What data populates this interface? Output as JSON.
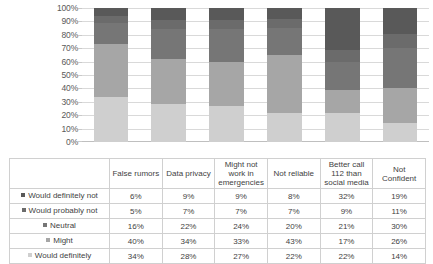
{
  "chart_data": {
    "type": "bar",
    "stacked": true,
    "normalized_percent": true,
    "title": "",
    "subtitle": "",
    "xlabel": "",
    "ylabel": "",
    "ylim": [
      0,
      100
    ],
    "y_tick_labels": [
      "100%",
      "90%",
      "80%",
      "70%",
      "60%",
      "50%",
      "40%",
      "30%",
      "20%",
      "10%",
      "0%"
    ],
    "y_tick_values": [
      100,
      90,
      80,
      70,
      60,
      50,
      40,
      30,
      20,
      10,
      0
    ],
    "grid": "horizontal",
    "legend_position": "data-table-below",
    "categories": [
      "False rumors",
      "Data privacy",
      "Might not work in emergencies",
      "Not reliable",
      "Better call 112 than social media",
      "Not Confident"
    ],
    "series": [
      {
        "name": "Would definitely not",
        "color": "#595959",
        "stack_order": 5,
        "values": [
          6,
          9,
          9,
          8,
          32,
          19
        ],
        "labels": [
          "6%",
          "9%",
          "9%",
          "8%",
          "32%",
          "19%"
        ]
      },
      {
        "name": "Would probably not",
        "color": "#6b6b6b",
        "stack_order": 4,
        "values": [
          5,
          7,
          7,
          7,
          9,
          11
        ],
        "labels": [
          "5%",
          "7%",
          "7%",
          "7%",
          "9%",
          "11%"
        ]
      },
      {
        "name": "Neutral",
        "color": "#767676",
        "stack_order": 3,
        "values": [
          16,
          22,
          24,
          20,
          21,
          30
        ],
        "labels": [
          "16%",
          "22%",
          "24%",
          "20%",
          "21%",
          "30%"
        ]
      },
      {
        "name": "Might",
        "color": "#a6a6a6",
        "stack_order": 2,
        "values": [
          40,
          34,
          33,
          43,
          17,
          26
        ],
        "labels": [
          "40%",
          "34%",
          "33%",
          "43%",
          "17%",
          "26%"
        ]
      },
      {
        "name": "Would definitely",
        "color": "#cfcfcf",
        "stack_order": 1,
        "values": [
          34,
          28,
          27,
          22,
          22,
          14
        ],
        "labels": [
          "34%",
          "28%",
          "27%",
          "22%",
          "22%",
          "14%"
        ]
      }
    ]
  },
  "table": {
    "corner_label": "",
    "column_headers": [
      "False rumors",
      "Data privacy",
      "Might not work in emergencies",
      "Not reliable",
      "Better call 112 than social media",
      "Not Confident"
    ],
    "rows": [
      {
        "label": "Would definitely not",
        "swatch": "#595959",
        "values": [
          "6%",
          "9%",
          "9%",
          "8%",
          "32%",
          "19%"
        ]
      },
      {
        "label": "Would probably not",
        "swatch": "#6b6b6b",
        "values": [
          "5%",
          "7%",
          "7%",
          "7%",
          "9%",
          "11%"
        ]
      },
      {
        "label": "Neutral",
        "swatch": "#767676",
        "values": [
          "16%",
          "22%",
          "24%",
          "20%",
          "21%",
          "30%"
        ]
      },
      {
        "label": "Might",
        "swatch": "#a6a6a6",
        "values": [
          "40%",
          "34%",
          "33%",
          "43%",
          "17%",
          "26%"
        ]
      },
      {
        "label": "Would definitely",
        "swatch": "#cfcfcf",
        "values": [
          "34%",
          "28%",
          "27%",
          "22%",
          "22%",
          "14%"
        ]
      }
    ]
  },
  "colors": {
    "gridline": "#d9d9d9",
    "axis": "#bfbfbf",
    "table_border": "#d0d0d0",
    "text": "#3f3f3f",
    "tick_text": "#595959",
    "background": "#ffffff"
  }
}
